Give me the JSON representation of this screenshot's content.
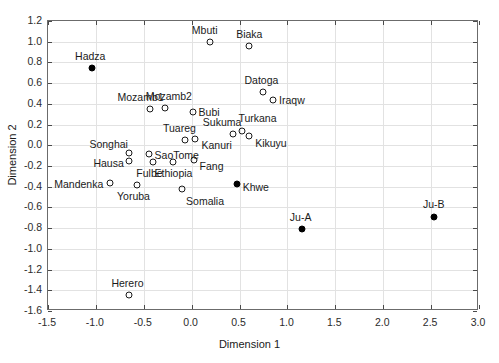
{
  "chart_data": {
    "type": "scatter",
    "title": "",
    "xlabel": "Dimension 1",
    "ylabel": "Dimension 2",
    "xlim": [
      -1.5,
      3.0
    ],
    "ylim": [
      -1.6,
      1.2
    ],
    "xticks": [
      "-1.5",
      "-1.0",
      "-0.5",
      "0.0",
      "0.5",
      "1.0",
      "1.5",
      "2.0",
      "2.5",
      "3.0"
    ],
    "yticks": [
      "1.2",
      "1.0",
      "0.8",
      "0.6",
      "0.4",
      "0.2",
      "0.0",
      "-0.2",
      "-0.4",
      "-0.6",
      "-0.8",
      "-1.0",
      "-1.2",
      "-1.4",
      "-1.6"
    ],
    "grid": true,
    "legend": "none",
    "series": [
      {
        "name": "Open circle populations",
        "marker": "open-circle",
        "points": [
          {
            "label": "Mbuti",
            "x": 0.19,
            "y": 1.0,
            "lx": -18,
            "ly": -17
          },
          {
            "label": "Biaka",
            "x": 0.6,
            "y": 0.96,
            "lx": -13,
            "ly": -17
          },
          {
            "label": "Datoga",
            "x": 0.74,
            "y": 0.51,
            "lx": -18,
            "ly": -17
          },
          {
            "label": "Iraqw",
            "x": 0.85,
            "y": 0.44,
            "lx": 6,
            "ly": -5
          },
          {
            "label": "Mozamb1",
            "x": -0.44,
            "y": 0.35,
            "lx": -32,
            "ly": -17
          },
          {
            "label": "Mozamb2",
            "x": -0.28,
            "y": 0.36,
            "lx": -19,
            "ly": -17
          },
          {
            "label": "Bubi",
            "x": 0.01,
            "y": 0.32,
            "lx": 6,
            "ly": -5
          },
          {
            "label": "Sukuma",
            "x": 0.43,
            "y": 0.11,
            "lx": -30,
            "ly": -17
          },
          {
            "label": "Turkana",
            "x": 0.53,
            "y": 0.14,
            "lx": -4,
            "ly": -18
          },
          {
            "label": "Kikuyu",
            "x": 0.6,
            "y": 0.09,
            "lx": 6,
            "ly": 2
          },
          {
            "label": "Tuareg",
            "x": -0.07,
            "y": 0.05,
            "lx": -22,
            "ly": -17
          },
          {
            "label": "Kanuri",
            "x": 0.04,
            "y": 0.06,
            "lx": 6,
            "ly": 1
          },
          {
            "label": "Songhai",
            "x": -0.65,
            "y": -0.07,
            "lx": -40,
            "ly": -14
          },
          {
            "label": "SaoTome",
            "x": -0.45,
            "y": -0.08,
            "lx": 6,
            "ly": -4
          },
          {
            "label": "Hausa",
            "x": -0.65,
            "y": -0.15,
            "lx": -36,
            "ly": -3
          },
          {
            "label": "Fulbe",
            "x": -0.4,
            "y": -0.16,
            "lx": -17,
            "ly": 6
          },
          {
            "label": "Ethiopia",
            "x": -0.2,
            "y": -0.16,
            "lx": -18,
            "ly": 6
          },
          {
            "label": "Fang",
            "x": 0.02,
            "y": -0.14,
            "lx": 6,
            "ly": 1
          },
          {
            "label": "Mandenka",
            "x": -0.85,
            "y": -0.36,
            "lx": -56,
            "ly": -4
          },
          {
            "label": "Yoruba",
            "x": -0.57,
            "y": -0.38,
            "lx": -20,
            "ly": 6
          },
          {
            "label": "Somalia",
            "x": -0.1,
            "y": -0.42,
            "lx": 4,
            "ly": 7
          },
          {
            "label": "Herero",
            "x": -0.65,
            "y": -1.45,
            "lx": -18,
            "ly": -17
          }
        ]
      },
      {
        "name": "Filled circle populations",
        "marker": "filled-circle",
        "points": [
          {
            "label": "Hadza",
            "x": -1.04,
            "y": 0.75,
            "lx": -17,
            "ly": -17
          },
          {
            "label": "Khwe",
            "x": 0.47,
            "y": -0.37,
            "lx": 6,
            "ly": -2
          },
          {
            "label": "Ju-A",
            "x": 1.15,
            "y": -0.81,
            "lx": -12,
            "ly": -17
          },
          {
            "label": "Ju-B",
            "x": 2.53,
            "y": -0.69,
            "lx": -11,
            "ly": -18
          }
        ]
      }
    ]
  }
}
